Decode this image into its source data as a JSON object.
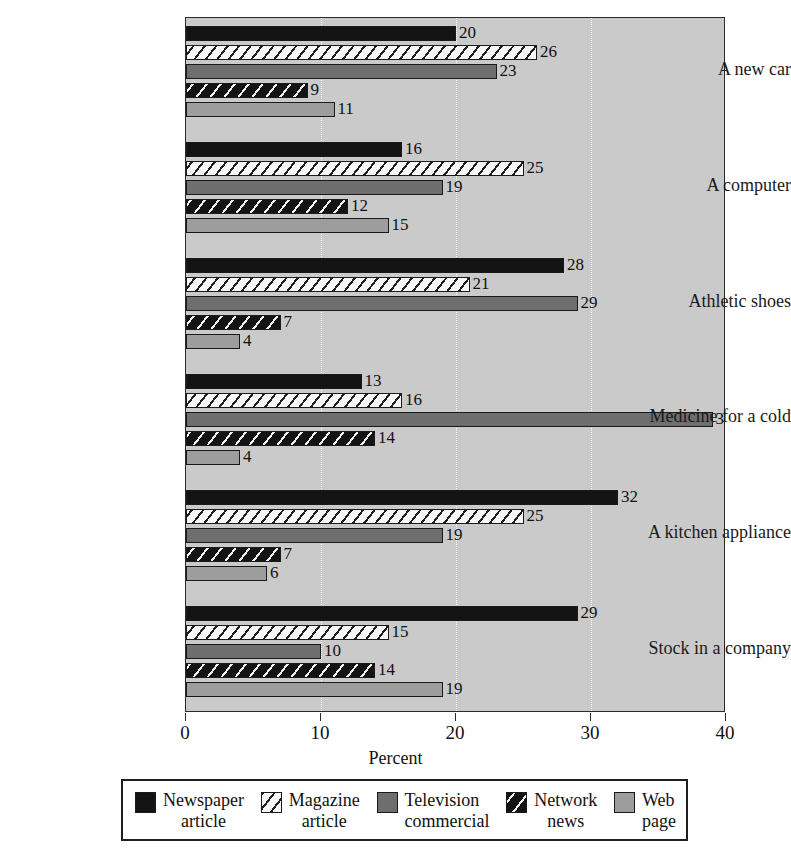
{
  "chart_data": {
    "type": "bar",
    "orientation": "horizontal",
    "title": "",
    "xlabel": "Percent",
    "ylabel": "",
    "xlim": [
      0,
      40
    ],
    "xticks": [
      0,
      10,
      20,
      30,
      40
    ],
    "grid": true,
    "legend_position": "bottom",
    "categories": [
      "A new car",
      "A computer",
      "Athletic shoes",
      "Medicine for a cold",
      "A kitchen appliance",
      "Stock in a company"
    ],
    "series": [
      {
        "name": "Newspaper article",
        "pattern": "solid-black",
        "values": [
          20,
          16,
          28,
          13,
          32,
          29
        ]
      },
      {
        "name": "Magazine article",
        "pattern": "hatch-white",
        "values": [
          26,
          25,
          21,
          16,
          25,
          15
        ]
      },
      {
        "name": "Television commercial",
        "pattern": "solid-gray",
        "values": [
          23,
          19,
          29,
          39,
          19,
          10
        ]
      },
      {
        "name": "Network news",
        "pattern": "hatch-black",
        "values": [
          9,
          12,
          7,
          14,
          7,
          14
        ]
      },
      {
        "name": "Web page",
        "pattern": "solid-ltgray",
        "values": [
          11,
          15,
          4,
          4,
          6,
          19
        ]
      }
    ]
  },
  "axis": {
    "x_title": "Percent",
    "tick_labels": [
      "0",
      "10",
      "20",
      "30",
      "40"
    ]
  },
  "legend": {
    "items": [
      {
        "line1": "Newspaper",
        "line2": "article"
      },
      {
        "line1": "Magazine",
        "line2": "article"
      },
      {
        "line1": "Television",
        "line2": "commercial"
      },
      {
        "line1": "Network",
        "line2": "news"
      },
      {
        "line1": "Web",
        "line2": "page"
      }
    ]
  },
  "title_sliver": "",
  "colors": {
    "plot_background": "#cacaca",
    "series_0": "#141414",
    "series_1": "#f7f7f7",
    "series_2": "#6e6e6e",
    "series_3": "#141414",
    "series_4": "#9d9d9d",
    "gridline": "#ffffff",
    "frame": "#2b2b2b"
  }
}
